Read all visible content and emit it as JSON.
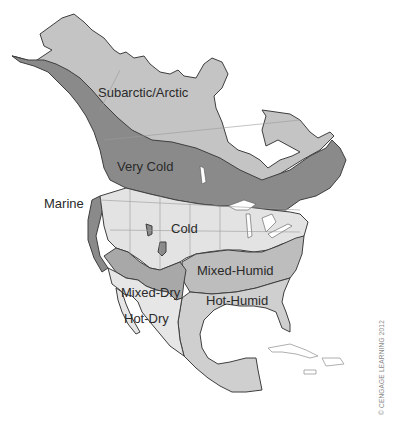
{
  "map": {
    "title": "North American Climate Zones",
    "regions": [
      {
        "id": "subarctic-arctic",
        "label": "Subarctic/Arctic",
        "color": "#c4c4c4"
      },
      {
        "id": "very-cold",
        "label": "Very Cold",
        "color": "#8a8a8a"
      },
      {
        "id": "marine",
        "label": "Marine",
        "color": "#8a8a8a"
      },
      {
        "id": "cold",
        "label": "Cold",
        "color": "#e3e3e3"
      },
      {
        "id": "mixed-humid",
        "label": "Mixed-Humid",
        "color": "#bdbdbd"
      },
      {
        "id": "mixed-dry",
        "label": "Mixed-Dry",
        "color": "#a8a8a8"
      },
      {
        "id": "hot-humid",
        "label": "Hot-Humid",
        "color": "#cfcfcf"
      },
      {
        "id": "hot-dry",
        "label": "Hot-Dry",
        "color": "#e6e6e6"
      }
    ],
    "labels": {
      "subarctic": "Subarctic/Arctic",
      "very_cold": "Very Cold",
      "marine": "Marine",
      "cold": "Cold",
      "mixed_humid": "Mixed-Humid",
      "mixed_dry": "Mixed-Dry",
      "hot_humid": "Hot-Humid",
      "hot_dry": "Hot-Dry"
    },
    "credit": "© CENGAGE LEARNING 2012"
  }
}
